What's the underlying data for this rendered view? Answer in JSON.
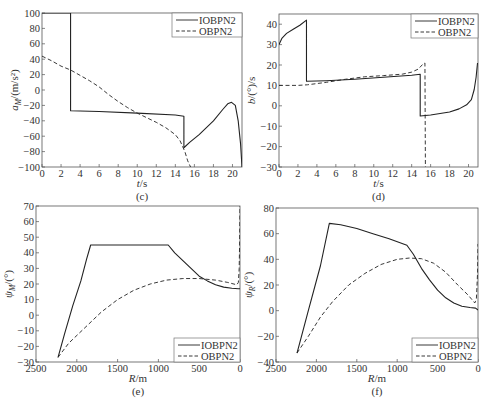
{
  "chart_data": [
    {
      "id": "c",
      "type": "line",
      "caption": "(c)",
      "title": "",
      "xlabel": "t/s",
      "ylabel": "a_M/(m/s²)",
      "ylabel_main": "a",
      "ylabel_sub": "M",
      "ylabel_rest": "/(m/s²)",
      "xlim": [
        0,
        21
      ],
      "ylim": [
        -100,
        100
      ],
      "xticks": [
        0,
        2,
        4,
        6,
        8,
        10,
        12,
        14,
        16,
        18,
        20
      ],
      "yticks": [
        -100,
        -80,
        -60,
        -40,
        -20,
        0,
        20,
        40,
        60,
        80,
        100
      ],
      "x_reversed": false,
      "grid": false,
      "legend_position": "upper right",
      "frame": {
        "left": 42,
        "top": 13,
        "right": 242,
        "bottom": 167
      },
      "legend_box": {
        "x": 172,
        "y": 13,
        "w": 70,
        "h": 24
      },
      "series": [
        {
          "name": "IOBPN2",
          "style": "solid",
          "points": [
            [
              0,
              100
            ],
            [
              3.0,
              100
            ],
            [
              3.0,
              -27
            ],
            [
              6,
              -28
            ],
            [
              10,
              -30
            ],
            [
              14,
              -32.5
            ],
            [
              14.9,
              -34
            ],
            [
              14.9,
              -75
            ],
            [
              15.5,
              -68
            ],
            [
              16.5,
              -58
            ],
            [
              18,
              -40
            ],
            [
              19,
              -25
            ],
            [
              19.5,
              -18
            ],
            [
              19.9,
              -16
            ],
            [
              20.3,
              -20
            ],
            [
              20.6,
              -40
            ],
            [
              20.85,
              -70
            ],
            [
              21,
              -100
            ]
          ]
        },
        {
          "name": "OBPN2",
          "style": "dashed",
          "points": [
            [
              0,
              44
            ],
            [
              1,
              38
            ],
            [
              2,
              31
            ],
            [
              3,
              26
            ],
            [
              4,
              19
            ],
            [
              5,
              12
            ],
            [
              6,
              4
            ],
            [
              7,
              -6
            ],
            [
              8,
              -15
            ],
            [
              9,
              -23
            ],
            [
              10,
              -30
            ],
            [
              11,
              -36
            ],
            [
              12,
              -42
            ],
            [
              13,
              -49
            ],
            [
              14,
              -58
            ],
            [
              14.5,
              -66
            ],
            [
              15,
              -80
            ],
            [
              15.3,
              -92
            ],
            [
              15.6,
              -100
            ]
          ]
        }
      ]
    },
    {
      "id": "d",
      "type": "line",
      "caption": "(d)",
      "title": "",
      "xlabel": "t/s",
      "ylabel": "b/(°)/s",
      "ylabel_main": "b",
      "ylabel_sub": "",
      "ylabel_rest": "/(°)/s",
      "xlim": [
        0,
        21
      ],
      "ylim": [
        -30,
        45
      ],
      "xticks": [
        0,
        2,
        4,
        6,
        8,
        10,
        12,
        14,
        16,
        18,
        20
      ],
      "yticks": [
        -30,
        -20,
        -10,
        0,
        10,
        20,
        30,
        40
      ],
      "x_reversed": false,
      "grid": false,
      "legend_position": "upper right",
      "frame": {
        "left": 279,
        "top": 14,
        "right": 478,
        "bottom": 167
      },
      "legend_box": {
        "x": 411,
        "y": 14,
        "w": 67,
        "h": 24
      },
      "series": [
        {
          "name": "IOBPN2",
          "style": "solid",
          "points": [
            [
              0,
              30
            ],
            [
              0.3,
              33
            ],
            [
              0.8,
              35.5
            ],
            [
              1.5,
              37.5
            ],
            [
              2.2,
              39.5
            ],
            [
              2.9,
              42
            ],
            [
              2.9,
              12
            ],
            [
              5,
              12.3
            ],
            [
              8,
              13
            ],
            [
              11,
              14
            ],
            [
              14,
              15
            ],
            [
              14.9,
              15.5
            ],
            [
              14.9,
              -5
            ],
            [
              16,
              -4.5
            ],
            [
              18,
              -3
            ],
            [
              19,
              -1.5
            ],
            [
              19.8,
              0.5
            ],
            [
              20.3,
              3
            ],
            [
              20.6,
              8
            ],
            [
              20.8,
              14
            ],
            [
              20.95,
              21
            ]
          ]
        },
        {
          "name": "OBPN2",
          "style": "dashed",
          "points": [
            [
              0,
              10
            ],
            [
              2,
              10
            ],
            [
              3,
              10.3
            ],
            [
              5,
              11.5
            ],
            [
              7,
              13
            ],
            [
              9,
              14.2
            ],
            [
              11,
              14.8
            ],
            [
              13,
              15.5
            ],
            [
              14,
              16.5
            ],
            [
              14.7,
              18
            ],
            [
              15.2,
              20.5
            ],
            [
              15.4,
              21
            ],
            [
              15.45,
              -30
            ]
          ]
        }
      ]
    },
    {
      "id": "e",
      "type": "line",
      "caption": "(e)",
      "title": "",
      "xlabel": "R/m",
      "ylabel": "ψ_M/(°)",
      "ylabel_main": "ψ",
      "ylabel_sub": "M",
      "ylabel_rest": "/(°)",
      "xlim": [
        2500,
        0
      ],
      "ylim": [
        -30,
        70
      ],
      "xticks": [
        2500,
        2000,
        1500,
        1000,
        500,
        0
      ],
      "yticks": [
        -30,
        -20,
        -10,
        0,
        10,
        20,
        30,
        40,
        50,
        60,
        70
      ],
      "x_reversed": true,
      "grid": false,
      "legend_position": "lower right",
      "frame": {
        "left": 36,
        "top": 206,
        "right": 240,
        "bottom": 362
      },
      "legend_box": {
        "x": 174,
        "y": 338,
        "w": 66,
        "h": 24
      },
      "series": [
        {
          "name": "IOBPN2",
          "style": "solid",
          "points": [
            [
              2230,
              -27
            ],
            [
              2150,
              -12
            ],
            [
              2050,
              6
            ],
            [
              1950,
              22
            ],
            [
              1880,
              36
            ],
            [
              1830,
              45
            ],
            [
              1500,
              45
            ],
            [
              1200,
              45
            ],
            [
              880,
              45
            ],
            [
              800,
              40
            ],
            [
              700,
              35
            ],
            [
              600,
              30
            ],
            [
              500,
              25
            ],
            [
              400,
              22
            ],
            [
              300,
              19.5
            ],
            [
              200,
              18
            ],
            [
              100,
              17.3
            ],
            [
              20,
              17
            ],
            [
              0,
              17
            ]
          ]
        },
        {
          "name": "OBPN2",
          "style": "dashed",
          "points": [
            [
              2230,
              -27
            ],
            [
              2100,
              -18
            ],
            [
              1900,
              -8
            ],
            [
              1700,
              2
            ],
            [
              1500,
              10
            ],
            [
              1300,
              16
            ],
            [
              1100,
              20
            ],
            [
              900,
              22.5
            ],
            [
              700,
              23.5
            ],
            [
              500,
              23.5
            ],
            [
              300,
              22.5
            ],
            [
              150,
              21
            ],
            [
              40,
              19.5
            ],
            [
              20,
              21
            ],
            [
              10,
              30
            ],
            [
              5,
              45
            ],
            [
              0,
              70
            ]
          ]
        }
      ]
    },
    {
      "id": "f",
      "type": "line",
      "caption": "(f)",
      "title": "",
      "xlabel": "R/m",
      "ylabel": "ψ_R/(°)",
      "ylabel_main": "ψ",
      "ylabel_sub": "R",
      "ylabel_rest": "/(°)",
      "xlim": [
        2500,
        0
      ],
      "ylim": [
        -40,
        80
      ],
      "xticks": [
        2500,
        2000,
        1500,
        1000,
        500,
        0
      ],
      "yticks": [
        -40,
        -20,
        0,
        20,
        40,
        60,
        80
      ],
      "x_reversed": true,
      "grid": false,
      "legend_position": "lower right",
      "frame": {
        "left": 276,
        "top": 208,
        "right": 478,
        "bottom": 362
      },
      "legend_box": {
        "x": 412,
        "y": 338,
        "w": 66,
        "h": 24
      },
      "series": [
        {
          "name": "IOBPN2",
          "style": "solid",
          "points": [
            [
              2240,
              -33
            ],
            [
              2100,
              0
            ],
            [
              1950,
              35
            ],
            [
              1840,
              68
            ],
            [
              1700,
              67
            ],
            [
              1500,
              64
            ],
            [
              1300,
              60
            ],
            [
              1100,
              56
            ],
            [
              880,
              51
            ],
            [
              800,
              44
            ],
            [
              700,
              33
            ],
            [
              600,
              24
            ],
            [
              500,
              16
            ],
            [
              400,
              10
            ],
            [
              300,
              6
            ],
            [
              200,
              3.5
            ],
            [
              100,
              2.5
            ],
            [
              30,
              2
            ],
            [
              0,
              0.5
            ]
          ]
        },
        {
          "name": "OBPN2",
          "style": "dashed",
          "points": [
            [
              2240,
              -33
            ],
            [
              2100,
              -20
            ],
            [
              1950,
              -5
            ],
            [
              1800,
              7
            ],
            [
              1600,
              20
            ],
            [
              1400,
              29
            ],
            [
              1200,
              36
            ],
            [
              1000,
              40
            ],
            [
              850,
              41
            ],
            [
              700,
              40.5
            ],
            [
              550,
              37
            ],
            [
              400,
              30
            ],
            [
              250,
              20
            ],
            [
              120,
              12
            ],
            [
              40,
              6
            ],
            [
              20,
              9
            ],
            [
              5,
              30
            ],
            [
              0,
              52
            ]
          ]
        }
      ]
    }
  ]
}
